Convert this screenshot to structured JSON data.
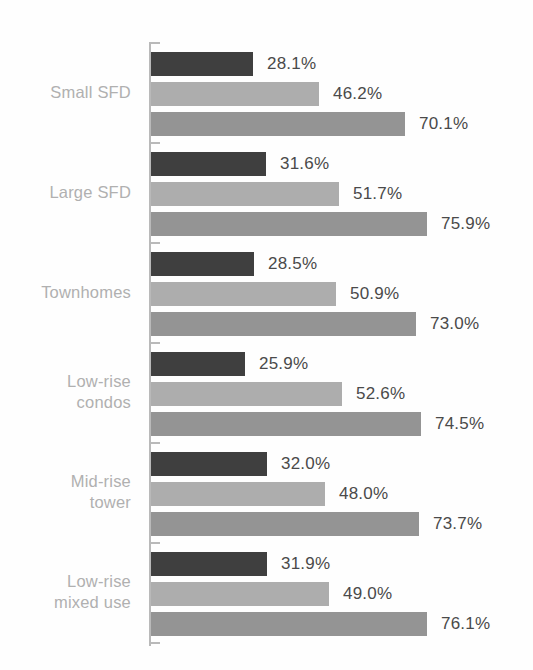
{
  "chart_data": {
    "type": "bar",
    "orientation": "horizontal",
    "title": "",
    "subtitle": "",
    "xlabel": "",
    "ylabel": "",
    "xlim": [
      0,
      100
    ],
    "grid": false,
    "legend": "none",
    "value_suffix": "%",
    "categories": [
      "Small SFD",
      "Large SFD",
      "Townhomes",
      "Low-rise condos",
      "Mid-rise tower",
      "Low-rise mixed use"
    ],
    "category_lines": [
      [
        "Small SFD"
      ],
      [
        "Large SFD"
      ],
      [
        "Townhomes"
      ],
      [
        "Low-rise",
        "condos"
      ],
      [
        "Mid-rise",
        "tower"
      ],
      [
        "Low-rise",
        "mixed use"
      ]
    ],
    "series": [
      {
        "name": "series-1",
        "color": "#3f3f3f",
        "values": [
          28.1,
          31.6,
          28.5,
          25.9,
          32.0,
          31.9
        ],
        "labels": [
          "28.1%",
          "31.6%",
          "28.5%",
          "25.9%",
          "32.0%",
          "31.9%"
        ]
      },
      {
        "name": "series-2",
        "color": "#adadad",
        "values": [
          46.2,
          51.7,
          50.9,
          52.6,
          48.0,
          49.0
        ],
        "labels": [
          "46.2%",
          "51.7%",
          "50.9%",
          "52.6%",
          "48.0%",
          "49.0%"
        ]
      },
      {
        "name": "series-3",
        "color": "#949494",
        "values": [
          70.1,
          75.9,
          73.0,
          74.5,
          73.7,
          76.1
        ],
        "labels": [
          "70.1%",
          "75.9%",
          "73.0%",
          "74.5%",
          "73.7%",
          "76.1%"
        ]
      }
    ]
  },
  "axis": {
    "color": "#b9b9b9",
    "tick_count": 7
  },
  "style": {
    "background": "#fefefe",
    "category_label_color": "#b0b0b0",
    "value_label_color": "#4a4a4a"
  }
}
